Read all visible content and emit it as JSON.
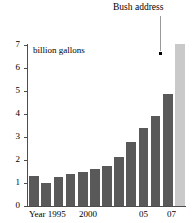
{
  "chart_data": {
    "type": "bar",
    "title": "",
    "subtitle": "",
    "xlabel": "",
    "ylabel": "billion gallons",
    "unit_label": "billion gallons",
    "categories": [
      "1995",
      "1996",
      "1997",
      "1998",
      "1999",
      "2000",
      "2001",
      "2002",
      "2003",
      "2004",
      "2005",
      "2006",
      "2007"
    ],
    "values": [
      1.3,
      1.0,
      1.25,
      1.4,
      1.47,
      1.6,
      1.75,
      2.1,
      2.75,
      3.35,
      3.9,
      4.85,
      7.0
    ],
    "ylim": [
      0,
      7
    ],
    "yticks": [
      0,
      1,
      2,
      3,
      4,
      5,
      6,
      7
    ],
    "ytick_labels": [
      "0",
      "1",
      "2",
      "3",
      "4",
      "5",
      "6",
      "7"
    ],
    "xtick_labels": [
      {
        "text": "Year 1995",
        "category_index": 0
      },
      {
        "text": "2000",
        "category_index": 5
      },
      {
        "text": "05",
        "category_index": 10
      },
      {
        "text": "07",
        "category_index": 12
      }
    ],
    "grid": false,
    "legend": null,
    "bar_color": "#595959",
    "highlight_color": "#c9c9c9",
    "highlight_index": 12,
    "annotations": [
      {
        "text": "Bush address",
        "target_category_index": 12,
        "target_value": 6.7,
        "marker": "dot",
        "leader_line": true
      }
    ]
  },
  "axis": {
    "y_axis_color": "#4d4d4d",
    "x_axis_color": "#4d4d4d"
  }
}
